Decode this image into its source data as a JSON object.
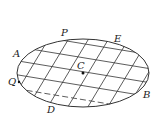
{
  "diagram": {
    "type": "ellipse-grid",
    "ellipse": {
      "cx": 83,
      "cy": 73,
      "rx": 66,
      "ry": 34,
      "stroke": "#333333"
    },
    "labels": {
      "P": {
        "text": "P",
        "x": 61,
        "y": 36
      },
      "E": {
        "text": "E",
        "x": 114,
        "y": 42
      },
      "A": {
        "text": "A",
        "x": 14,
        "y": 57
      },
      "Q": {
        "text": "Q",
        "x": 8,
        "y": 85
      },
      "C": {
        "text": "C",
        "x": 77,
        "y": 69
      },
      "D": {
        "text": "D",
        "x": 47,
        "y": 112
      },
      "B": {
        "text": "B",
        "x": 143,
        "y": 98
      }
    },
    "center_point": {
      "x": 83,
      "y": 73
    },
    "line_color": "#333333"
  }
}
